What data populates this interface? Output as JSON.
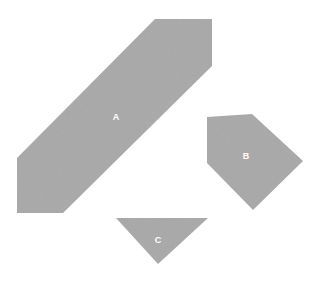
{
  "scene": {
    "title": "Geometric Shapes",
    "width": 314,
    "height": 283,
    "background_color": "#ffffff",
    "fill_color": "#a8a8a8",
    "label_color": "#ffffff"
  },
  "shapes": [
    {
      "id": "shape-a",
      "label": "A",
      "kind": "hexagon",
      "fill": "#a8a8a8",
      "label_x": 116,
      "label_y": 117,
      "points": [
        [
          155,
          19
        ],
        [
          212,
          19
        ],
        [
          212,
          66
        ],
        [
          63,
          213
        ],
        [
          17,
          213
        ],
        [
          17,
          158
        ]
      ]
    },
    {
      "id": "shape-b",
      "label": "B",
      "kind": "pentagon",
      "fill": "#a8a8a8",
      "label_x": 246,
      "label_y": 156,
      "points": [
        [
          207,
          117
        ],
        [
          252,
          114
        ],
        [
          303,
          161
        ],
        [
          253,
          210
        ],
        [
          207,
          163
        ]
      ]
    },
    {
      "id": "shape-c",
      "label": "C",
      "kind": "triangle",
      "fill": "#a8a8a8",
      "label_x": 158,
      "label_y": 240,
      "points": [
        [
          116,
          218
        ],
        [
          208,
          218
        ],
        [
          158,
          264
        ]
      ]
    }
  ]
}
